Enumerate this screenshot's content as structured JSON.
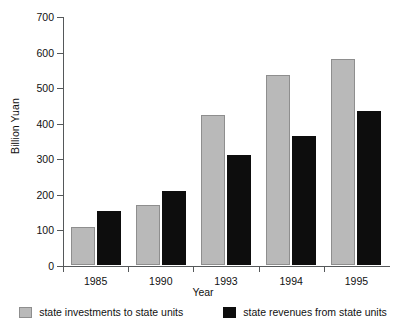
{
  "chart_data": {
    "type": "bar",
    "title": "",
    "xlabel": "Year",
    "ylabel": "Billion Yuan",
    "categories": [
      "1985",
      "1990",
      "1993",
      "1994",
      "1995"
    ],
    "series": [
      {
        "name": "state investments to state units",
        "color": "#b9b9b9",
        "values": [
          108,
          170,
          422,
          533,
          578
        ]
      },
      {
        "name": "state revenues from state units",
        "color": "#0d0d0d",
        "values": [
          152,
          208,
          310,
          362,
          433
        ]
      }
    ],
    "ylim": [
      0,
      700
    ],
    "yticks": [
      0,
      100,
      200,
      300,
      400,
      500,
      600,
      700
    ],
    "ytick_labels": [
      "0",
      "100",
      "200",
      "300",
      "400",
      "500",
      "600",
      "700"
    ],
    "grid": false,
    "legend_position": "bottom"
  }
}
